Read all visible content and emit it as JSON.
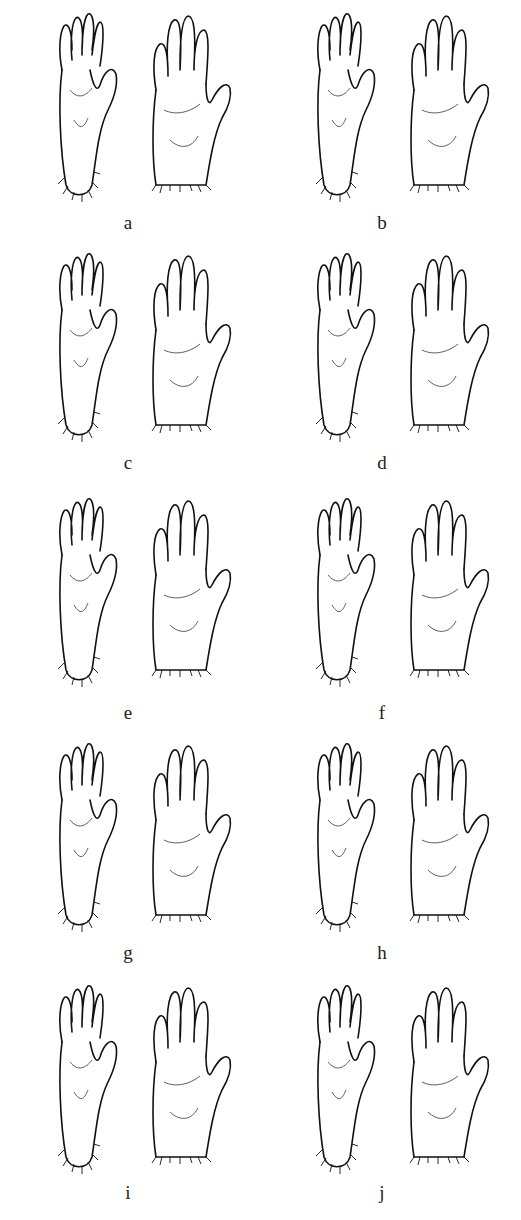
{
  "figure": {
    "panels": [
      {
        "label": "a",
        "row": 0,
        "col": 0
      },
      {
        "label": "b",
        "row": 0,
        "col": 1
      },
      {
        "label": "c",
        "row": 1,
        "col": 0
      },
      {
        "label": "d",
        "row": 1,
        "col": 1
      },
      {
        "label": "e",
        "row": 2,
        "col": 0
      },
      {
        "label": "f",
        "row": 2,
        "col": 1
      },
      {
        "label": "g",
        "row": 3,
        "col": 0
      },
      {
        "label": "h",
        "row": 3,
        "col": 1
      },
      {
        "label": "i",
        "row": 4,
        "col": 0
      },
      {
        "label": "j",
        "row": 4,
        "col": 1
      }
    ]
  }
}
